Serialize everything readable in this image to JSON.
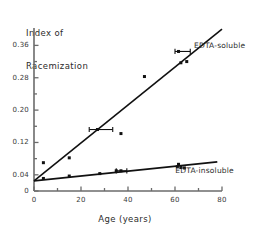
{
  "chart_data": {
    "type": "scatter",
    "title": "",
    "xlabel": "Age (years)",
    "ylabel": "Index of\nRacemization",
    "ylabel_lines": [
      "Index of",
      "Racemization"
    ],
    "xlim": [
      0,
      80
    ],
    "ylim": [
      0,
      0.403
    ],
    "grid": false,
    "legend_position": "inline-right",
    "xticks": [
      0,
      10,
      20,
      30,
      40,
      50,
      60,
      70,
      80
    ],
    "xtick_labels": [
      {
        "value": 0,
        "label": "0"
      },
      {
        "value": 20,
        "label": "20"
      },
      {
        "value": 40,
        "label": "40"
      },
      {
        "value": 60,
        "label": "60"
      },
      {
        "value": 80,
        "label": "80"
      }
    ],
    "yticks": [
      0,
      0.04,
      0.08,
      0.12,
      0.16,
      0.2,
      0.24,
      0.28,
      0.32,
      0.36
    ],
    "ytick_labels": [
      {
        "value": 0,
        "label": "0"
      },
      {
        "value": 0.04,
        "label": "0.04"
      },
      {
        "value": 0.12,
        "label": "0.12"
      },
      {
        "value": 0.2,
        "label": "0.20"
      },
      {
        "value": 0.28,
        "label": "0.28"
      },
      {
        "value": 0.36,
        "label": "0.36"
      }
    ],
    "series": [
      {
        "name": "EDTA-soluble",
        "annotation": "EDTA-soluble",
        "marker": "square",
        "color": "#111111",
        "fit_line": {
          "x0": 0,
          "y0": 0.025,
          "x1": 80,
          "y1": 0.4
        },
        "points": [
          {
            "x": 4,
            "y": 0.07
          },
          {
            "x": 15,
            "y": 0.082
          },
          {
            "x": 27,
            "y": 0.152,
            "xerr": [
              3.5,
              6.5
            ]
          },
          {
            "x": 37,
            "y": 0.142
          },
          {
            "x": 47,
            "y": 0.283
          },
          {
            "x": 61.5,
            "y": 0.345,
            "xerr": [
              1.5,
              5.0
            ]
          },
          {
            "x": 62.5,
            "y": 0.317
          },
          {
            "x": 65,
            "y": 0.32
          }
        ]
      },
      {
        "name": "EDTA-insoluble",
        "annotation": "EDTA-insoluble",
        "marker": "square",
        "color": "#111111",
        "fit_line": {
          "x0": 0,
          "y0": 0.025,
          "x1": 78,
          "y1": 0.072
        },
        "points": [
          {
            "x": 4,
            "y": 0.031
          },
          {
            "x": 15,
            "y": 0.037
          },
          {
            "x": 28,
            "y": 0.043
          },
          {
            "x": 35,
            "y": 0.05
          },
          {
            "x": 37,
            "y": 0.05,
            "xerr": [
              2.0,
              2.5
            ]
          },
          {
            "x": 61,
            "y": 0.06
          },
          {
            "x": 61.5,
            "y": 0.066
          },
          {
            "x": 62.5,
            "y": 0.058
          },
          {
            "x": 64,
            "y": 0.057
          }
        ]
      }
    ]
  },
  "style": {
    "axis_color": "#6b6b6b",
    "line_color": "#111111",
    "marker_color": "#111111",
    "text_color": "#2b2b2b",
    "background": "#ffffff"
  }
}
